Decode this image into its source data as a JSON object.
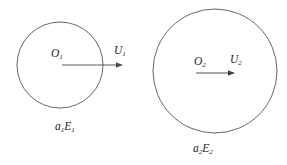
{
  "figure": {
    "background_color": "#ffffff",
    "stroke_color": "#4a4a4a",
    "text_color": "#262626",
    "bubbles": [
      {
        "id": "bubble-1",
        "center_label": "O",
        "center_label_sub": "1",
        "velocity_label": "U",
        "velocity_label_sub": "1",
        "property_label": "a",
        "property_label_sub": "1",
        "property_label_2": "E",
        "property_label_2_sub": "1",
        "center_x": 60,
        "center_y": 65,
        "radius": 43
      },
      {
        "id": "bubble-2",
        "center_label": "O",
        "center_label_sub": "2",
        "velocity_label": "U",
        "velocity_label_sub": "2",
        "property_label": "a",
        "property_label_sub": "2",
        "property_label_2": "E",
        "property_label_2_sub": "2",
        "center_x": 215,
        "center_y": 71,
        "radius": 62
      }
    ],
    "arrows": [
      {
        "id": "arrow-1",
        "x1": 62,
        "y1": 65,
        "x2": 124,
        "y2": 65
      },
      {
        "id": "arrow-2",
        "x1": 196,
        "y1": 73,
        "x2": 236,
        "y2": 73
      }
    ]
  }
}
